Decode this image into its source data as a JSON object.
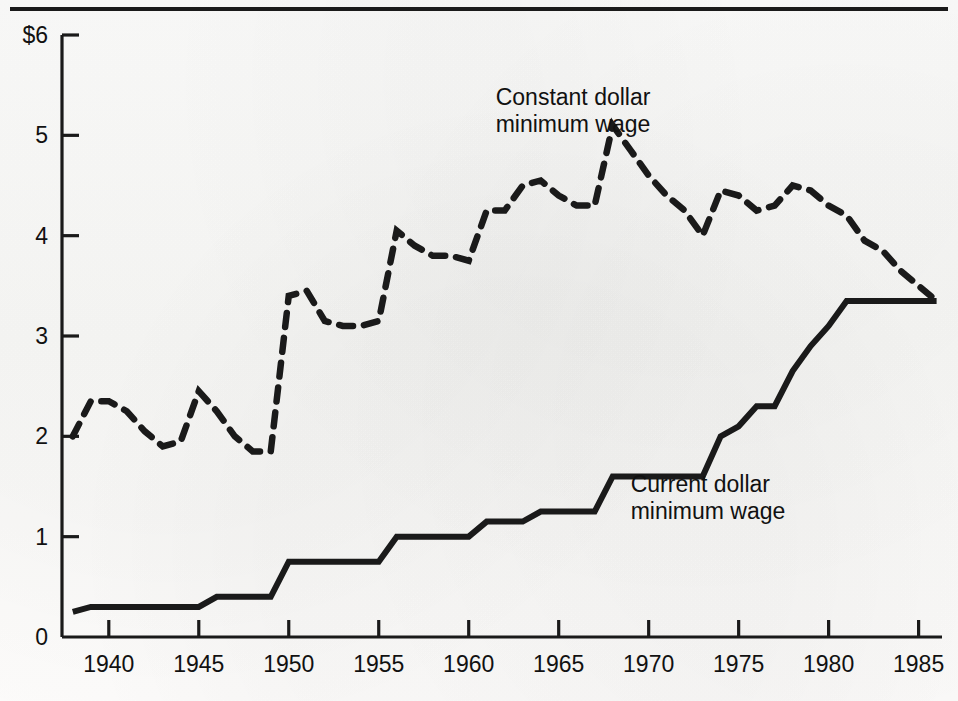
{
  "figure": {
    "top_rule": true,
    "background_color": "#fbfbfa",
    "ink_color": "#1a1a1a"
  },
  "axis": {
    "currency_prefix": "$",
    "y_ticks": [
      "6",
      "5",
      "4",
      "3",
      "2",
      "1",
      "0"
    ],
    "y_tick_values": [
      6,
      5,
      4,
      3,
      2,
      1,
      0
    ],
    "x_ticks": [
      "1940",
      "1945",
      "1950",
      "1955",
      "1960",
      "1965",
      "1970",
      "1975",
      "1980",
      "1985"
    ],
    "x_tick_values": [
      1940,
      1945,
      1950,
      1955,
      1960,
      1965,
      1970,
      1975,
      1980,
      1985
    ]
  },
  "annotations": {
    "constant": {
      "line1": "Constant dollar",
      "line2": "minimum wage",
      "x": 1961.5,
      "y": 5.3
    },
    "current": {
      "line1": "Current dollar",
      "line2": "minimum wage",
      "x": 1969.0,
      "y": 1.45
    }
  },
  "chart_data": {
    "type": "line",
    "title": "",
    "subtitle": "",
    "xlabel": "",
    "ylabel": "",
    "xlim": [
      1937.4,
      1986.3
    ],
    "ylim": [
      0,
      6
    ],
    "grid": false,
    "legend": "inline-annotations",
    "x": [
      1938,
      1939,
      1940,
      1941,
      1942,
      1943,
      1944,
      1945,
      1946,
      1947,
      1948,
      1949,
      1950,
      1951,
      1952,
      1953,
      1954,
      1955,
      1956,
      1957,
      1958,
      1959,
      1960,
      1961,
      1962,
      1963,
      1964,
      1965,
      1966,
      1967,
      1968,
      1969,
      1970,
      1971,
      1972,
      1973,
      1974,
      1975,
      1976,
      1977,
      1978,
      1979,
      1980,
      1981,
      1982,
      1983,
      1984,
      1985,
      1986
    ],
    "series": [
      {
        "name": "Current dollar minimum wage",
        "style": "solid",
        "values": [
          0.25,
          0.3,
          0.3,
          0.3,
          0.3,
          0.3,
          0.3,
          0.3,
          0.4,
          0.4,
          0.4,
          0.4,
          0.75,
          0.75,
          0.75,
          0.75,
          0.75,
          0.75,
          1.0,
          1.0,
          1.0,
          1.0,
          1.0,
          1.15,
          1.15,
          1.15,
          1.25,
          1.25,
          1.25,
          1.25,
          1.6,
          1.6,
          1.6,
          1.6,
          1.6,
          1.6,
          2.0,
          2.1,
          2.3,
          2.3,
          2.65,
          2.9,
          3.1,
          3.35,
          3.35,
          3.35,
          3.35,
          3.35,
          3.35
        ]
      },
      {
        "name": "Constant dollar minimum wage",
        "style": "dashed",
        "values": [
          2.0,
          2.35,
          2.35,
          2.25,
          2.05,
          1.9,
          1.95,
          2.45,
          2.25,
          2.0,
          1.85,
          1.85,
          3.4,
          3.45,
          3.15,
          3.1,
          3.1,
          3.15,
          4.05,
          3.9,
          3.8,
          3.8,
          3.75,
          4.25,
          4.25,
          4.5,
          4.55,
          4.4,
          4.3,
          4.3,
          5.1,
          4.85,
          4.6,
          4.4,
          4.25,
          4.0,
          4.45,
          4.4,
          4.25,
          4.3,
          4.5,
          4.45,
          4.3,
          4.2,
          3.95,
          3.85,
          3.65,
          3.5,
          3.35
        ]
      }
    ]
  }
}
